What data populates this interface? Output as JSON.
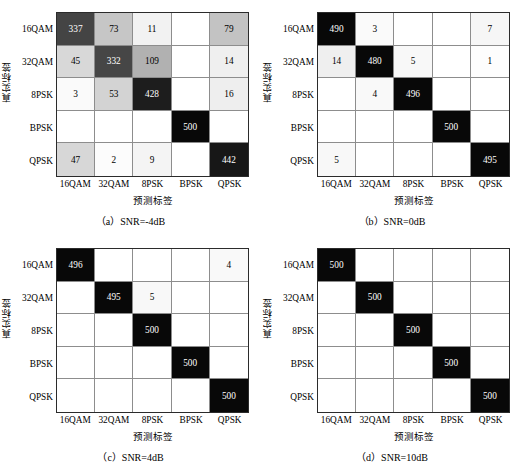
{
  "figure": {
    "axis_labels": {
      "y": "真实标签",
      "x": "预测标签"
    },
    "classes": [
      "16QAM",
      "32QAM",
      "8PSK",
      "BPSK",
      "QPSK"
    ],
    "colors": {
      "grid_line": "#8d8d8d",
      "frame": "#2b2b2b",
      "max_fill": "#0a0a0a",
      "min_fill": "#ffffff",
      "text_light": "#ffffff",
      "text_dark": "#000000"
    },
    "total_per_row": 500
  },
  "chart_data": [
    {
      "type": "heatmap",
      "panel_id": "a",
      "title": "（a）SNR=-4dB",
      "xlabel": "预测标签",
      "ylabel": "真实标签",
      "row_categories": [
        "16QAM",
        "32QAM",
        "8PSK",
        "BPSK",
        "QPSK"
      ],
      "col_categories": [
        "16QAM",
        "32QAM",
        "8PSK",
        "BPSK",
        "QPSK"
      ],
      "zlim": [
        0,
        500
      ],
      "grid": true,
      "values": [
        [
          337,
          73,
          11,
          null,
          79
        ],
        [
          45,
          332,
          109,
          null,
          14
        ],
        [
          3,
          53,
          428,
          null,
          16
        ],
        [
          null,
          null,
          null,
          500,
          null
        ],
        [
          47,
          2,
          9,
          null,
          442
        ]
      ]
    },
    {
      "type": "heatmap",
      "panel_id": "b",
      "title": "（b）SNR=0dB",
      "xlabel": "预测标签",
      "ylabel": "真实标签",
      "row_categories": [
        "16QAM",
        "32QAM",
        "8PSK",
        "BPSK",
        "QPSK"
      ],
      "col_categories": [
        "16QAM",
        "32QAM",
        "8PSK",
        "BPSK",
        "QPSK"
      ],
      "zlim": [
        0,
        500
      ],
      "grid": true,
      "values": [
        [
          490,
          3,
          null,
          null,
          7
        ],
        [
          14,
          480,
          5,
          null,
          1
        ],
        [
          null,
          4,
          496,
          null,
          null
        ],
        [
          null,
          null,
          null,
          500,
          null
        ],
        [
          5,
          null,
          null,
          null,
          495
        ]
      ]
    },
    {
      "type": "heatmap",
      "panel_id": "c",
      "title": "（c）SNR=4dB",
      "xlabel": "预测标签",
      "ylabel": "真实标签",
      "row_categories": [
        "16QAM",
        "32QAM",
        "8PSK",
        "BPSK",
        "QPSK"
      ],
      "col_categories": [
        "16QAM",
        "32QAM",
        "8PSK",
        "BPSK",
        "QPSK"
      ],
      "zlim": [
        0,
        500
      ],
      "grid": true,
      "values": [
        [
          496,
          null,
          null,
          null,
          4
        ],
        [
          null,
          495,
          5,
          null,
          null
        ],
        [
          null,
          null,
          500,
          null,
          null
        ],
        [
          null,
          null,
          null,
          500,
          null
        ],
        [
          null,
          null,
          null,
          null,
          500
        ]
      ]
    },
    {
      "type": "heatmap",
      "panel_id": "d",
      "title": "（d）SNR=10dB",
      "xlabel": "预测标签",
      "ylabel": "真实标签",
      "row_categories": [
        "16QAM",
        "32QAM",
        "8PSK",
        "BPSK",
        "QPSK"
      ],
      "col_categories": [
        "16QAM",
        "32QAM",
        "8PSK",
        "BPSK",
        "QPSK"
      ],
      "zlim": [
        0,
        500
      ],
      "grid": true,
      "values": [
        [
          500,
          null,
          null,
          null,
          null
        ],
        [
          null,
          500,
          null,
          null,
          null
        ],
        [
          null,
          null,
          500,
          null,
          null
        ],
        [
          null,
          null,
          null,
          500,
          null
        ],
        [
          null,
          null,
          null,
          null,
          500
        ]
      ]
    }
  ]
}
